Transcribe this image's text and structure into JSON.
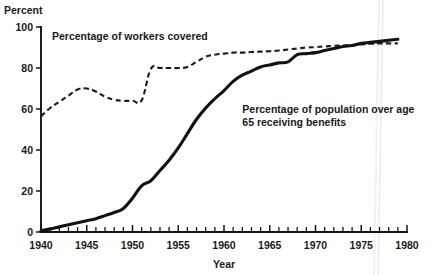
{
  "chart_data": {
    "type": "line",
    "title": "",
    "ylabel": "Percent",
    "xlabel": "Year",
    "xlim": [
      1940,
      1980
    ],
    "ylim": [
      0,
      100
    ],
    "grid": false,
    "legend": "inline-annotations",
    "x_ticks_major": [
      1940,
      1945,
      1950,
      1955,
      1960,
      1965,
      1970,
      1975,
      1980
    ],
    "x_tick_labels": [
      "1940",
      "1945",
      "1950",
      "1955",
      "1960",
      "1965",
      "1970",
      "1975",
      "1980"
    ],
    "x_ticks_minor_interval": 1,
    "y_ticks": [
      0,
      20,
      40,
      60,
      80,
      100
    ],
    "y_tick_labels": [
      "0",
      "20",
      "40",
      "60",
      "80",
      "100"
    ],
    "annotations": [
      {
        "name": "workers-covered-label",
        "lines": [
          "Percentage of workers covered"
        ],
        "x": 1941.2,
        "y": 93.5
      },
      {
        "name": "population-benefits-label",
        "lines": [
          "Percentage of population over age",
          "65 receiving benefits"
        ],
        "x": 1962.0,
        "y": 58.0
      }
    ],
    "series": [
      {
        "name": "Percentage of workers covered",
        "style": "dashed",
        "x": [
          1940,
          1941,
          1942,
          1943,
          1944,
          1945,
          1946,
          1947,
          1948,
          1949,
          1950,
          1951,
          1952,
          1953,
          1954,
          1955,
          1956,
          1957,
          1958,
          1959,
          1960,
          1961,
          1962,
          1963,
          1964,
          1965,
          1966,
          1967,
          1968,
          1969,
          1970,
          1971,
          1972,
          1973,
          1974,
          1975,
          1976,
          1977,
          1978,
          1979
        ],
        "values": [
          56.5,
          60.5,
          63.5,
          66.5,
          69.5,
          70.0,
          68.5,
          66.0,
          64.5,
          64.0,
          64.0,
          64.2,
          79.5,
          80.0,
          80.0,
          80.0,
          80.5,
          83.0,
          85.5,
          86.5,
          87.0,
          87.5,
          87.5,
          87.8,
          88.0,
          88.2,
          88.5,
          89.0,
          89.5,
          90.0,
          90.2,
          90.5,
          90.8,
          91.0,
          91.2,
          91.5,
          91.8,
          92.0,
          92.0,
          92.0
        ]
      },
      {
        "name": "Percentage of population over age 65 receiving benefits",
        "style": "solid",
        "x": [
          1940,
          1941,
          1942,
          1943,
          1944,
          1945,
          1946,
          1947,
          1948,
          1949,
          1950,
          1951,
          1952,
          1953,
          1954,
          1955,
          1956,
          1957,
          1958,
          1959,
          1960,
          1961,
          1962,
          1963,
          1964,
          1965,
          1966,
          1967,
          1968,
          1969,
          1970,
          1971,
          1972,
          1973,
          1974,
          1975,
          1976,
          1977,
          1978,
          1979
        ],
        "values": [
          0.6,
          1.5,
          2.5,
          3.5,
          4.5,
          5.5,
          6.5,
          8.0,
          9.5,
          11.5,
          16.5,
          22.5,
          25.0,
          30.0,
          35.0,
          41.0,
          48.0,
          55.0,
          60.5,
          65.0,
          69.0,
          73.5,
          76.5,
          78.5,
          80.5,
          81.5,
          82.5,
          83.0,
          86.5,
          87.0,
          87.5,
          88.5,
          89.5,
          90.5,
          91.0,
          92.0,
          92.5,
          93.0,
          93.5,
          94.0
        ]
      }
    ]
  },
  "colors": {
    "ink": "#141414",
    "background": "#ffffff"
  },
  "layout": {
    "plot_left": 41,
    "plot_right": 407,
    "plot_top": 27,
    "plot_bottom": 232
  }
}
